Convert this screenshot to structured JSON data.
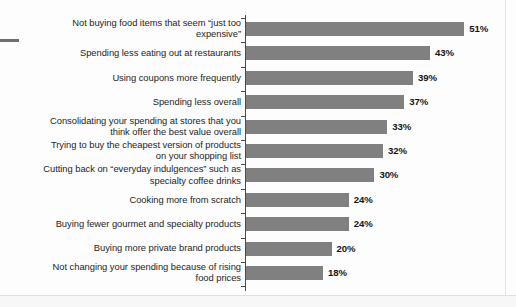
{
  "figure": {
    "background_color": "#fdfdfd",
    "bar_color": "#808080",
    "axis_color": "#4a4a4a",
    "text_color": "#1d1d1d"
  },
  "chart_data": {
    "type": "bar",
    "orientation": "horizontal",
    "title": "",
    "subtitle": "",
    "xlabel": "",
    "ylabel": "",
    "grid": false,
    "legend": "none",
    "xlim": [
      0,
      60
    ],
    "value_suffix": "%",
    "categories": [
      "Not buying food items that seem “just too expensive”",
      "Spending less eating out at restaurants",
      "Using coupons more frequently",
      "Spending less overall",
      "Consolidating your spending at stores that you think offer the best value overall",
      "Trying to buy the cheapest version of products on your shopping list",
      "Cutting back on “everyday indulgences” such as specialty coffee drinks",
      "Cooking more from scratch",
      "Buying fewer gourmet and specialty products",
      "Buying more private brand products",
      "Not changing your spending because of rising food prices"
    ],
    "values": [
      51,
      43,
      39,
      37,
      33,
      32,
      30,
      24,
      24,
      20,
      18
    ],
    "value_labels": [
      "51%",
      "43%",
      "39%",
      "37%",
      "33%",
      "32%",
      "30%",
      "24%",
      "24%",
      "20%",
      "18%"
    ],
    "bars": [
      {
        "label_lines": [
          "Not buying food items that seem “just too",
          "expensive”"
        ],
        "value": 51,
        "value_label": "51%"
      },
      {
        "label_lines": [
          "Spending less eating out at restaurants"
        ],
        "value": 43,
        "value_label": "43%"
      },
      {
        "label_lines": [
          "Using coupons more frequently"
        ],
        "value": 39,
        "value_label": "39%"
      },
      {
        "label_lines": [
          "Spending less overall"
        ],
        "value": 37,
        "value_label": "37%"
      },
      {
        "label_lines": [
          "Consolidating your spending at stores that you",
          "think offer the best value overall"
        ],
        "value": 33,
        "value_label": "33%"
      },
      {
        "label_lines": [
          "Trying to buy the cheapest version of products",
          "on your shopping list"
        ],
        "value": 32,
        "value_label": "32%"
      },
      {
        "label_lines": [
          "Cutting back on “everyday indulgences” such as",
          "specialty coffee drinks"
        ],
        "value": 30,
        "value_label": "30%"
      },
      {
        "label_lines": [
          "Cooking more from scratch"
        ],
        "value": 24,
        "value_label": "24%"
      },
      {
        "label_lines": [
          "Buying fewer gourmet and specialty products"
        ],
        "value": 24,
        "value_label": "24%"
      },
      {
        "label_lines": [
          "Buying more private brand products"
        ],
        "value": 20,
        "value_label": "20%"
      },
      {
        "label_lines": [
          "Not changing your spending because of rising",
          "food prices"
        ],
        "value": 18,
        "value_label": "18%"
      }
    ]
  }
}
